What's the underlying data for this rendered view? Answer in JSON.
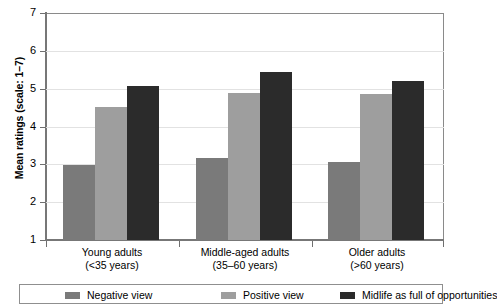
{
  "chart_data": {
    "type": "bar",
    "title": "",
    "xlabel": "",
    "ylabel": "Mean ratings (scale: 1–7)",
    "ylim": [
      1,
      7
    ],
    "yticks": [
      1,
      2,
      3,
      4,
      5,
      6,
      7
    ],
    "ytick_labels": [
      "1",
      "2",
      "3",
      "4",
      "5",
      "6",
      "7"
    ],
    "grid": true,
    "legend_position": "bottom",
    "categories": [
      "Young adults\n(<35 years)",
      "Middle-aged adults\n(35–60 years)",
      "Older adults\n(>60 years)"
    ],
    "category_lines": [
      {
        "line1": "Young adults",
        "line2": "(<35 years)"
      },
      {
        "line1": "Middle-aged adults",
        "line2": "(35–60 years)"
      },
      {
        "line1": "Older adults",
        "line2": "(>60 years)"
      }
    ],
    "series": [
      {
        "name": "Negative view",
        "color": "#7a7a7a",
        "values": [
          2.98,
          3.17,
          3.06
        ]
      },
      {
        "name": "Positive view",
        "color": "#9e9e9e",
        "values": [
          4.51,
          4.88,
          4.85
        ]
      },
      {
        "name": "Midlife as full of opportunities",
        "color": "#2b2b2b",
        "values": [
          5.07,
          5.43,
          5.2
        ]
      }
    ]
  },
  "axis": {
    "y_title": "Mean ratings (scale: 1–7)",
    "tick_7": "7",
    "tick_6": "6",
    "tick_5": "5",
    "tick_4": "4",
    "tick_3": "3",
    "tick_2": "2",
    "tick_1": "1"
  },
  "legend": {
    "items": [
      {
        "label": "Negative view",
        "color": "#7a7a7a"
      },
      {
        "label": "Positive view",
        "color": "#9e9e9e"
      },
      {
        "label": "Midlife as full of opportunities",
        "color": "#2b2b2b"
      }
    ]
  },
  "categories_display": [
    {
      "line1": "Young adults",
      "line2": "(<35 years)"
    },
    {
      "line1": "Middle-aged adults",
      "line2": "(35–60 years)"
    },
    {
      "line1": "Older adults",
      "line2": "(>60 years)"
    }
  ]
}
